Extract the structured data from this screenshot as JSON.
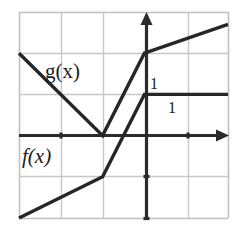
{
  "figure": {
    "width": 244,
    "height": 232,
    "background_color": "#ffffff",
    "grid_color": "#c8c8c8",
    "curve_color": "#262626",
    "axis_color": "#2b2b2b"
  },
  "labels": {
    "g_label": "g(x)",
    "f_label": "f(x)",
    "unit_y": "1",
    "unit_x": "1"
  },
  "chart_data": {
    "type": "line",
    "xlabel": "",
    "ylabel": "",
    "xlim": [
      -3,
      2
    ],
    "ylim": [
      -2,
      3
    ],
    "grid": true,
    "gridlines_x": [
      -3,
      -2,
      -1,
      0,
      1,
      2
    ],
    "gridlines_y": [
      -2,
      -1,
      0,
      1,
      2,
      3
    ],
    "axes": {
      "x_axis_y": 0,
      "y_axis_x": 0,
      "x_axis_arrow": "right",
      "y_axis_arrow": "up"
    },
    "legend": "inline-annotations",
    "annotations": [
      {
        "text": "g(x)",
        "x": -2.15,
        "y": 1.6
      },
      {
        "text": "f(x)",
        "x": -2.75,
        "y": -0.5
      },
      {
        "text": "1",
        "x": 0.15,
        "y": 1.28
      },
      {
        "text": "1",
        "x": 0.57,
        "y": 0.73
      }
    ],
    "series": [
      {
        "name": "g(x)",
        "color": "#262626",
        "points": [
          {
            "x": -3,
            "y": 2
          },
          {
            "x": -1,
            "y": 0
          },
          {
            "x": 0,
            "y": 2
          },
          {
            "x": 2,
            "y": 2.7
          }
        ]
      },
      {
        "name": "f(x)",
        "color": "#262626",
        "points": [
          {
            "x": -3,
            "y": -2
          },
          {
            "x": -1,
            "y": -1
          },
          {
            "x": 0,
            "y": 1
          },
          {
            "x": 2,
            "y": 1
          }
        ]
      }
    ]
  }
}
